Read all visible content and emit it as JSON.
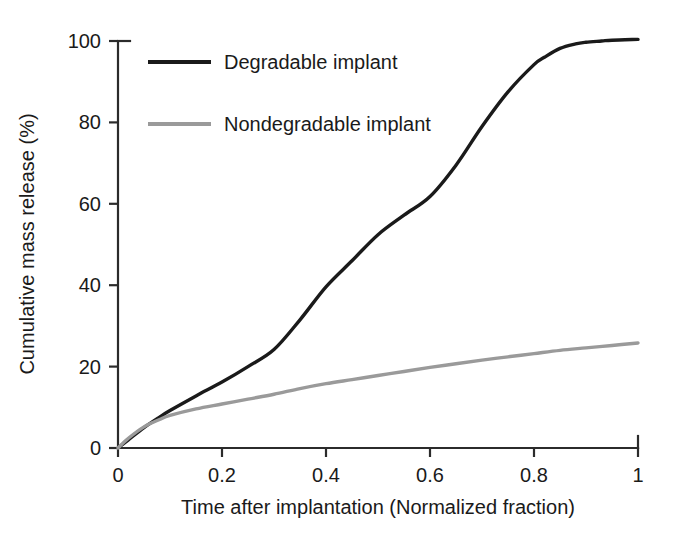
{
  "chart_data": {
    "type": "line",
    "title": "",
    "subtitle": "",
    "xlabel": "Time after implantation (Normalized fraction)",
    "ylabel": "Cumulative mass release (%)",
    "xlim": [
      0,
      1
    ],
    "ylim": [
      0,
      100
    ],
    "xticks": [
      0,
      0.2,
      0.4,
      0.6,
      0.8,
      1
    ],
    "xtick_labels": [
      "0",
      "0.2",
      "0.4",
      "0.6",
      "0.8",
      "1"
    ],
    "yticks": [
      0,
      20,
      40,
      60,
      80,
      100
    ],
    "ytick_labels": [
      "0",
      "20",
      "40",
      "60",
      "80",
      "100"
    ],
    "grid": false,
    "legend_position": "top-left",
    "series": [
      {
        "name": "Degradable implant",
        "color": "#1a1a1a",
        "linewidth": 3.4,
        "x": [
          0,
          0.02,
          0.05,
          0.08,
          0.1,
          0.15,
          0.2,
          0.25,
          0.3,
          0.35,
          0.4,
          0.45,
          0.5,
          0.55,
          0.6,
          0.65,
          0.7,
          0.75,
          0.8,
          0.82,
          0.85,
          0.88,
          0.9,
          0.93,
          0.95,
          1
        ],
        "values": [
          0,
          2.0,
          5.0,
          7.6,
          9.2,
          12.8,
          16.2,
          20.0,
          24.2,
          31.5,
          39.6,
          46.0,
          52.4,
          57.2,
          61.8,
          69.5,
          79.0,
          87.5,
          94.2,
          96.0,
          98.2,
          99.3,
          99.7,
          100.0,
          100.2,
          100.4
        ]
      },
      {
        "name": "Nondegradable implant",
        "color": "#9a9a9a",
        "linewidth": 3.4,
        "x": [
          0,
          0.02,
          0.05,
          0.08,
          0.1,
          0.15,
          0.2,
          0.25,
          0.3,
          0.35,
          0.4,
          0.45,
          0.5,
          0.55,
          0.6,
          0.65,
          0.7,
          0.75,
          0.8,
          0.85,
          0.9,
          0.95,
          1
        ],
        "values": [
          0,
          2.4,
          5.2,
          7.0,
          8.0,
          9.6,
          10.8,
          12.0,
          13.2,
          14.6,
          15.8,
          16.8,
          17.8,
          18.8,
          19.8,
          20.7,
          21.6,
          22.4,
          23.2,
          24.0,
          24.6,
          25.2,
          25.8
        ]
      }
    ]
  },
  "legend": {
    "entries": [
      {
        "label": "Degradable implant",
        "swatch_color": "#1a1a1a"
      },
      {
        "label": "Nondegradable implant",
        "swatch_color": "#9a9a9a"
      }
    ]
  },
  "axes": {
    "x_title": "Time after implantation (Normalized fraction)",
    "y_title": "Cumulative mass release (%)"
  },
  "colors": {
    "background": "#ffffff",
    "axis": "#2b2b2b",
    "text": "#1a1a1a",
    "degradable": "#1a1a1a",
    "nondegradable": "#9a9a9a"
  }
}
